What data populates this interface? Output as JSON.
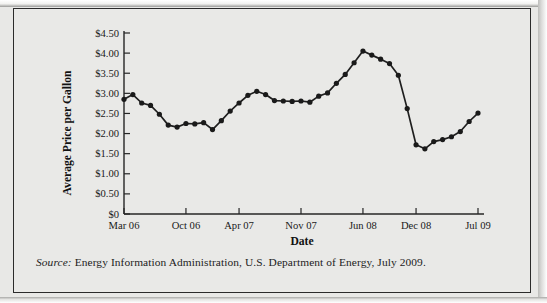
{
  "figure": {
    "source_label": "Source:",
    "source_text": " Energy Information Administration, U.S. Department of Energy, July 2009."
  },
  "chart_data": {
    "type": "line",
    "title": "",
    "xlabel": "Date",
    "ylabel": "Average Price per Gallon",
    "ylim": [
      0,
      4.5
    ],
    "ytick_values": [
      0,
      0.5,
      1.0,
      1.5,
      2.0,
      2.5,
      3.0,
      3.5,
      4.0,
      4.5
    ],
    "ytick_labels": [
      "$0",
      "$0.50",
      "$1.00",
      "$1.50",
      "$2.00",
      "$2.50",
      "$3.00",
      "$3.50",
      "$4.00",
      "$4.50"
    ],
    "xtick_labels": [
      "Mar 06",
      "Oct 06",
      "Apr 07",
      "Nov 07",
      "Jun 08",
      "Dec 08",
      "Jul 09"
    ],
    "xtick_indices": [
      0,
      7,
      13,
      20,
      27,
      33,
      40
    ],
    "grid": false,
    "legend": false,
    "markers": true,
    "categories": [
      "Mar 06",
      "Apr 06",
      "May 06",
      "Jun 06",
      "Jul 06",
      "Aug 06",
      "Sep 06",
      "Oct 06",
      "Nov 06",
      "Dec 06",
      "Jan 07",
      "Feb 07",
      "Mar 07",
      "Apr 07",
      "May 07",
      "Jun 07",
      "Jul 07",
      "Aug 07",
      "Sep 07",
      "Oct 07",
      "Nov 07",
      "Dec 07",
      "Jan 08",
      "Feb 08",
      "Mar 08",
      "Apr 08",
      "May 08",
      "Jun 08",
      "Jul 08",
      "Aug 08",
      "Sep 08",
      "Oct 08",
      "Nov 08",
      "Dec 08",
      "Jan 09",
      "Feb 09",
      "Mar 09",
      "Apr 09",
      "May 09",
      "Jun 09",
      "Jul 09"
    ],
    "values": [
      2.85,
      2.97,
      2.76,
      2.7,
      2.48,
      2.21,
      2.16,
      2.25,
      2.24,
      2.27,
      2.1,
      2.32,
      2.56,
      2.76,
      2.95,
      3.05,
      2.97,
      2.82,
      2.81,
      2.8,
      2.81,
      2.78,
      2.93,
      3.01,
      3.25,
      3.47,
      3.76,
      4.05,
      3.95,
      3.85,
      3.74,
      3.45,
      2.62,
      1.72,
      1.62,
      1.8,
      1.85,
      1.92,
      2.05,
      2.3,
      2.51
    ],
    "series_name": "Average Price per Gallon"
  }
}
